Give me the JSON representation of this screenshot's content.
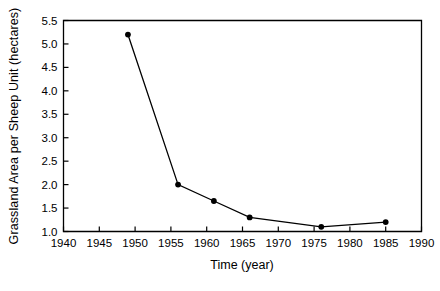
{
  "chart_data": {
    "type": "line",
    "title": "",
    "xlabel": "Time (year)",
    "ylabel": "Grassland Area per Sheep Unit (hectares)",
    "x": [
      1949,
      1956,
      1961,
      1966,
      1976,
      1985
    ],
    "values": [
      5.2,
      2.0,
      1.65,
      1.3,
      1.1,
      1.2
    ],
    "series": [
      {
        "name": "Grassland Area per Sheep Unit",
        "x": [
          1949,
          1956,
          1961,
          1966,
          1976,
          1985
        ],
        "values": [
          5.2,
          2.0,
          1.65,
          1.3,
          1.1,
          1.2
        ]
      }
    ],
    "xlim": [
      1940,
      1990
    ],
    "ylim": [
      1.0,
      5.5
    ],
    "xticks": [
      1940,
      1945,
      1950,
      1955,
      1960,
      1965,
      1970,
      1975,
      1980,
      1985,
      1990
    ],
    "xtick_labels": [
      "1940",
      "1945",
      "1950",
      "1955",
      "1960",
      "1965",
      "1970",
      "1975",
      "1980",
      "1985",
      "1990"
    ],
    "yticks": [
      1.0,
      1.5,
      2.0,
      2.5,
      3.0,
      3.5,
      4.0,
      4.5,
      5.0,
      5.5
    ],
    "ytick_labels": [
      "1.0",
      "1.5",
      "2.0",
      "2.5",
      "3.0",
      "3.5",
      "4.0",
      "4.5",
      "5.0",
      "5.5"
    ],
    "grid": false,
    "legend": null,
    "legend_position": "none",
    "marker": "filled-circle",
    "line_color": "#000000",
    "marker_color": "#000000",
    "background_color": "#ffffff",
    "axis_color": "#000000"
  }
}
